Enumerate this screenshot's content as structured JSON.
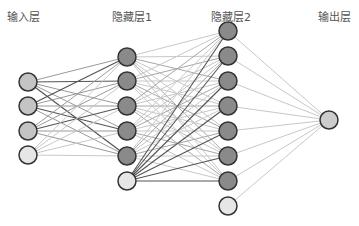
{
  "diagram": {
    "layers": [
      {
        "name": "input",
        "label": "输入层",
        "x": 28,
        "label_x": 23,
        "nodes": [
          {
            "y": 82,
            "type": "neuron",
            "fill": "#c4c4c4"
          },
          {
            "y": 106,
            "type": "neuron",
            "fill": "#c4c4c4"
          },
          {
            "y": 131,
            "type": "neuron",
            "fill": "#c4c4c4"
          },
          {
            "y": 155,
            "type": "bias",
            "fill": "#e6e6e6"
          }
        ]
      },
      {
        "name": "hidden1",
        "label": "隐藏层1",
        "x": 127,
        "label_x": 132,
        "nodes": [
          {
            "y": 57,
            "type": "neuron",
            "fill": "#8a8a8a"
          },
          {
            "y": 81,
            "type": "neuron",
            "fill": "#8a8a8a"
          },
          {
            "y": 106,
            "type": "neuron",
            "fill": "#8a8a8a"
          },
          {
            "y": 131,
            "type": "neuron",
            "fill": "#8a8a8a"
          },
          {
            "y": 156,
            "type": "neuron",
            "fill": "#8a8a8a"
          },
          {
            "y": 181,
            "type": "bias",
            "fill": "#e6e6e6"
          }
        ]
      },
      {
        "name": "hidden2",
        "label": "隐藏层2",
        "x": 228,
        "label_x": 231,
        "nodes": [
          {
            "y": 31,
            "type": "neuron",
            "fill": "#8a8a8a"
          },
          {
            "y": 56,
            "type": "neuron",
            "fill": "#8a8a8a"
          },
          {
            "y": 81,
            "type": "neuron",
            "fill": "#8a8a8a"
          },
          {
            "y": 106,
            "type": "neuron",
            "fill": "#8a8a8a"
          },
          {
            "y": 131,
            "type": "neuron",
            "fill": "#8a8a8a"
          },
          {
            "y": 156,
            "type": "neuron",
            "fill": "#8a8a8a"
          },
          {
            "y": 181,
            "type": "neuron",
            "fill": "#8a8a8a"
          },
          {
            "y": 206,
            "type": "bias",
            "fill": "#e6e6e6"
          }
        ]
      },
      {
        "name": "output",
        "label": "输出层",
        "x": 329,
        "label_x": 334,
        "nodes": [
          {
            "y": 120,
            "type": "neuron",
            "fill": "#cccccc"
          }
        ]
      }
    ],
    "node_radius": 9,
    "node_stroke": "#333333",
    "edge_colors": {
      "dark": "#555555",
      "light": "#c8c8c8"
    }
  }
}
